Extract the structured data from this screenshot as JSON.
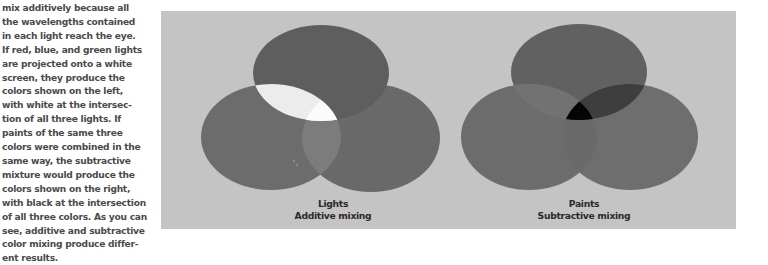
{
  "body_text": {
    "lines": [
      "mix additively because all",
      "the wavelengths contained",
      "in each light reach the eye.",
      "If red, blue, and green lights",
      "are projected onto a white",
      "screen, they produce the",
      "colors shown on the left,",
      "with white at the intersec-",
      "tion of all three lights. If",
      "paints of the same three",
      "colors were combined in the",
      "same way, the subtractive",
      "mixture would produce the",
      "colors shown on the right,",
      "with black at the intersection",
      "of all three colors. As you can",
      "see, additive and subtractive",
      "color mixing produce differ-",
      "ent results."
    ]
  },
  "figures": {
    "lights": {
      "title": "Lights",
      "subtitle": "Additive mixing",
      "colors": {
        "top": "#5e5e5e",
        "left": "#6c6c6c",
        "right": "#696969",
        "top_left_overlap": "#ececec",
        "left_right_overlap": "#7c7c7c",
        "center": "#fbfbfb"
      }
    },
    "paints": {
      "title": "Paints",
      "subtitle": "Subtractive mixing",
      "colors": {
        "top": "#616161",
        "left": "#6c6c6c",
        "right": "#6e6e6e",
        "top_left_overlap": "#727272",
        "top_right_overlap": "#3e3e3e",
        "left_right_overlap": "#6a6a6a",
        "center": "#050505"
      }
    }
  },
  "panel": {
    "background": "#c4c4c4"
  }
}
